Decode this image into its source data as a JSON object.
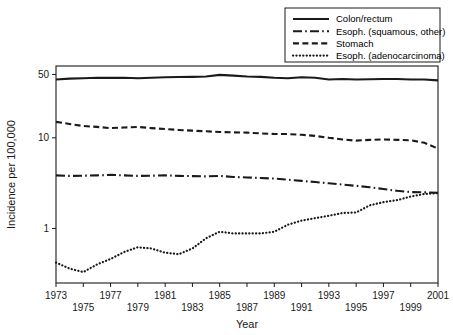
{
  "chart_data": {
    "type": "line",
    "title": "",
    "xlabel": "Year",
    "ylabel": "Incidence per 100,000",
    "yscale": "log",
    "ylim": [
      0.25,
      62
    ],
    "xlim": [
      1973,
      2001
    ],
    "yticks": [
      1,
      10,
      50
    ],
    "ytick_labels": [
      "1",
      "10",
      "50"
    ],
    "grid": false,
    "legend_position": "top-right",
    "x": [
      1973,
      1974,
      1975,
      1976,
      1977,
      1978,
      1979,
      1980,
      1981,
      1982,
      1983,
      1984,
      1985,
      1986,
      1987,
      1988,
      1989,
      1990,
      1991,
      1992,
      1993,
      1994,
      1995,
      1996,
      1997,
      1998,
      1999,
      2000,
      2001
    ],
    "xtick_labels_upper": [
      "1973",
      "1977",
      "1981",
      "1985",
      "1989",
      "1993",
      "1997",
      "2001"
    ],
    "xtick_labels_lower": [
      "1975",
      "1979",
      "1983",
      "1987",
      "1991",
      "1995",
      "1999"
    ],
    "series": [
      {
        "name": "Colon/rectum",
        "style": "solid",
        "values": [
          44.0,
          45.0,
          45.5,
          46.0,
          45.8,
          46.0,
          45.5,
          46.0,
          46.5,
          46.8,
          47.0,
          47.5,
          49.5,
          48.5,
          47.5,
          47.0,
          46.0,
          45.5,
          46.5,
          46.0,
          44.0,
          44.5,
          44.0,
          44.2,
          44.5,
          44.5,
          44.0,
          44.0,
          43.0
        ]
      },
      {
        "name": "Esoph. (squamous, other)",
        "style": "dashdot",
        "values": [
          3.85,
          3.8,
          3.82,
          3.85,
          3.9,
          3.85,
          3.8,
          3.82,
          3.85,
          3.8,
          3.78,
          3.75,
          3.8,
          3.7,
          3.65,
          3.6,
          3.55,
          3.45,
          3.35,
          3.25,
          3.15,
          3.05,
          2.95,
          2.85,
          2.72,
          2.6,
          2.52,
          2.5,
          2.48
        ]
      },
      {
        "name": "Stomach",
        "style": "dashed",
        "values": [
          15.0,
          14.2,
          13.5,
          13.2,
          12.8,
          13.0,
          13.2,
          12.8,
          12.5,
          12.2,
          12.0,
          11.8,
          11.6,
          11.5,
          11.4,
          11.2,
          11.0,
          11.0,
          10.8,
          10.5,
          10.0,
          9.6,
          9.3,
          9.5,
          9.6,
          9.5,
          9.4,
          8.8,
          7.6
        ]
      },
      {
        "name": "Esoph. (adenocarcinoma)",
        "style": "dotted",
        "values": [
          0.42,
          0.36,
          0.33,
          0.4,
          0.46,
          0.55,
          0.62,
          0.6,
          0.54,
          0.52,
          0.6,
          0.78,
          0.92,
          0.88,
          0.88,
          0.88,
          0.92,
          1.1,
          1.22,
          1.3,
          1.38,
          1.48,
          1.5,
          1.8,
          1.95,
          2.05,
          2.25,
          2.4,
          2.45
        ]
      }
    ]
  },
  "legend": {
    "items": [
      {
        "label": "Colon/rectum",
        "style": "solid"
      },
      {
        "label": "Esoph. (squamous, other)",
        "style": "dashdot"
      },
      {
        "label": "Stomach",
        "style": "dashed"
      },
      {
        "label": "Esoph. (adenocarcinoma)",
        "style": "dotted"
      }
    ]
  }
}
